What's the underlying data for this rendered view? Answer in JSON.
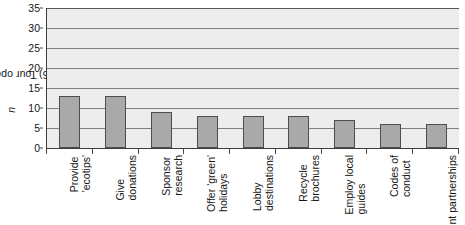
{
  "chart_data": {
    "type": "bar",
    "title": "",
    "xlabel": "",
    "ylabel": "Tour operators (n=36)",
    "ylabel_prefix": "Tour operators (",
    "ylabel_italic": "n",
    "ylabel_suffix": "=36)",
    "ylim": [
      0,
      35
    ],
    "ytick_step": 5,
    "yticks": [
      "0",
      "5",
      "10",
      "15",
      "20",
      "25",
      "30",
      "35"
    ],
    "grid": true,
    "grid_axis": "y",
    "legend": false,
    "categories": [
      "Provide 'ecotips'",
      "Give donations",
      "Sponsor research",
      "Offer 'green' holidays",
      "Lobby destinations",
      "Recycle brochures",
      "Employ local guides",
      "Codes of conduct",
      "Waste management partnerships"
    ],
    "category_lines": [
      [
        "Provide",
        "'ecotips'"
      ],
      [
        "Give",
        "donations"
      ],
      [
        "Sponsor",
        "research"
      ],
      [
        "Offer 'green'",
        "holidays"
      ],
      [
        "Lobby",
        "destinations"
      ],
      [
        "Recycle",
        "brochures"
      ],
      [
        "Employ local",
        "guides"
      ],
      [
        "Codes of",
        "conduct"
      ],
      [
        "Waste",
        "management partnerships"
      ]
    ],
    "values": [
      13,
      13,
      9,
      8,
      8,
      8,
      7,
      6,
      6
    ],
    "colors": {
      "bar_fill": "#a9a9a9",
      "bar_border": "#4d4d4d",
      "plot_background": "#ededed",
      "gridline": "#808080",
      "axis": "#3d3d3d",
      "text": "#161616",
      "page_background": "#ffffff"
    }
  }
}
